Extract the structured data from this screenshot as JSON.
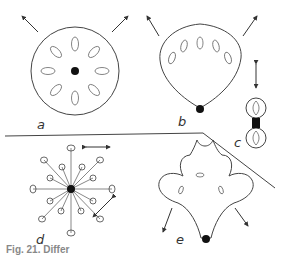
{
  "figure": {
    "caption": "Fig. 21. Differ",
    "panels": [
      {
        "id": "a",
        "label": "a",
        "shape": "circle with radial ovules and central black dot",
        "arrows": 2
      },
      {
        "id": "b",
        "label": "b",
        "shape": "fan/rounded sack with arc of ovules and black dot at base",
        "arrows": 2
      },
      {
        "id": "c",
        "label": "c",
        "shape": "two-lobed figure-eight with black dot at center",
        "arrows": 1
      },
      {
        "id": "d",
        "label": "d",
        "shape": "radial star of stalked ovules around black dot",
        "arrows": 2
      },
      {
        "id": "e",
        "label": "e",
        "shape": "five-lobed flower-like form with black dot at base",
        "arrows": 2
      }
    ]
  },
  "colors": {
    "stroke": "#444444",
    "fill_dot": "#111111",
    "background": "#ffffff"
  }
}
